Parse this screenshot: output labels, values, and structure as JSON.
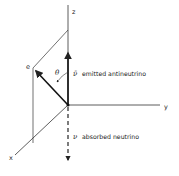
{
  "diagram": {
    "axes": {
      "z": "z",
      "y": "y",
      "x": "x"
    },
    "electron_label": "e",
    "angle_label": "θ",
    "antineutrino": {
      "symbol": "ν̄",
      "label": "emitted antineutrino"
    },
    "neutrino": {
      "symbol": "ν",
      "label": "absorbed neutrino"
    },
    "colors": {
      "ink": "#222222",
      "background": "#ffffff"
    }
  }
}
